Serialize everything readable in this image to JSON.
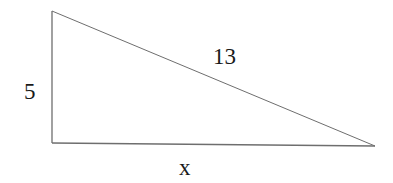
{
  "diagram": {
    "type": "right-triangle",
    "stroke_color": "#6e6e6e",
    "vertices": {
      "top": [
        52,
        11
      ],
      "right_angle": [
        52,
        143
      ],
      "right": [
        375,
        146
      ]
    },
    "labels": {
      "vertical_leg": "5",
      "hypotenuse": "13",
      "horizontal_leg": "x"
    }
  }
}
